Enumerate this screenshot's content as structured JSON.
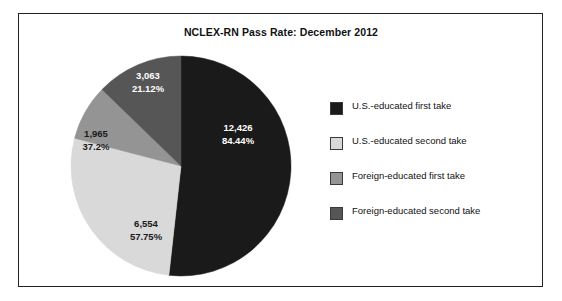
{
  "chart_data": {
    "type": "pie",
    "title": "NCLEX-RN Pass Rate: December 2012",
    "categories": [
      "U.S.-educated first take",
      "U.S.-educated second take",
      "Foreign-educated first take",
      "Foreign-educated second take"
    ],
    "values": [
      12426,
      6554,
      1965,
      3063
    ],
    "value_labels": [
      "12,426",
      "6,554",
      "1,965",
      "3,063"
    ],
    "percent_labels": [
      "84.44%",
      "57.75%",
      "37.2%",
      "21.12%"
    ],
    "slice_colors": [
      "#1a1a1a",
      "#d9d9d9",
      "#949494",
      "#565656"
    ],
    "label_text_colors": [
      "#ffffff",
      "#1a1a1a",
      "#1a1a1a",
      "#ffffff"
    ],
    "start_angle_deg": 0,
    "direction": "clockwise",
    "legend_position": "right",
    "grid": false,
    "xlabel": "",
    "ylabel": ""
  },
  "legend": {
    "items": [
      {
        "label": "U.S.-educated first take",
        "color": "#1a1a1a"
      },
      {
        "label": "U.S.-educated second take",
        "color": "#d9d9d9"
      },
      {
        "label": "Foreign-educated first take",
        "color": "#949494"
      },
      {
        "label": "Foreign-educated second take",
        "color": "#565656"
      }
    ]
  }
}
